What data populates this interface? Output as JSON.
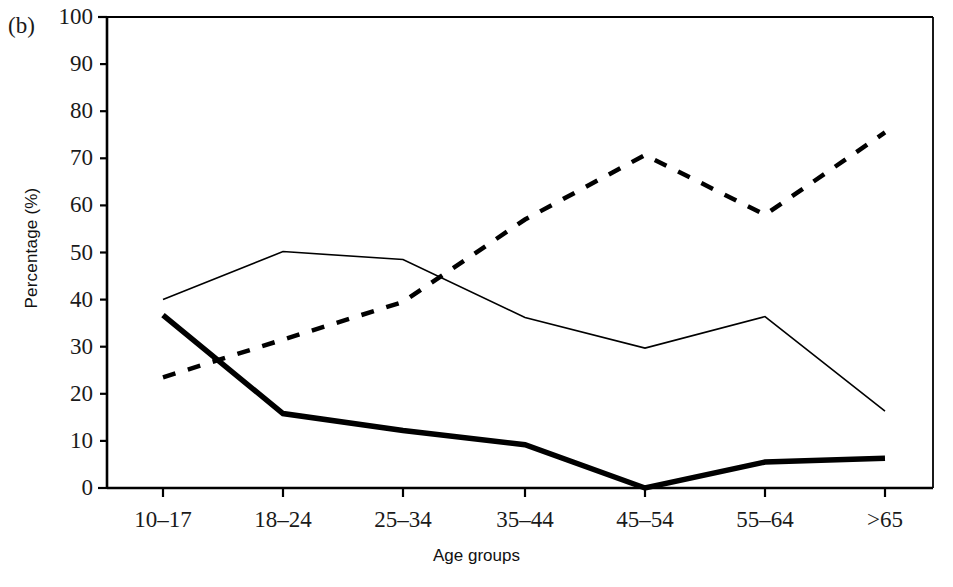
{
  "figure": {
    "panel_label": "(b)",
    "xlabel": "Age groups",
    "ylabel": "Percentage (%)"
  },
  "chart_data": {
    "type": "line",
    "title": "",
    "subtitle": "",
    "panel_label": "(b)",
    "xlabel": "Age groups",
    "ylabel": "Percentage (%)",
    "categories": [
      "10–17",
      "18–24",
      "25–34",
      "35–44",
      "45–54",
      "55–64",
      ">65"
    ],
    "ylim": [
      0,
      100
    ],
    "yticks": [
      0,
      10,
      20,
      30,
      40,
      50,
      60,
      70,
      80,
      90,
      100
    ],
    "ytick_labels": [
      "0",
      "10",
      "20",
      "30",
      "40",
      "50",
      "60",
      "70",
      "80",
      "90",
      "100"
    ],
    "grid": false,
    "legend": false,
    "legend_position": "none",
    "series": [
      {
        "name": "thin-solid-line",
        "style": "solid",
        "line_width": 1.6,
        "color": "#000000",
        "values": [
          40.0,
          50.2,
          48.5,
          36.2,
          29.7,
          36.4,
          16.3
        ]
      },
      {
        "name": "thick-solid-line",
        "style": "solid",
        "line_width": 5.5,
        "color": "#000000",
        "values": [
          36.7,
          15.8,
          12.2,
          9.2,
          0.0,
          5.5,
          6.3
        ]
      },
      {
        "name": "dashed-line",
        "style": "dashed",
        "line_width": 4.5,
        "color": "#000000",
        "values": [
          23.5,
          31.5,
          39.5,
          57.0,
          70.7,
          58.0,
          75.5
        ]
      }
    ]
  },
  "axes": {
    "x_positions": [
      163,
      283,
      403,
      525,
      645,
      765,
      885
    ],
    "plot_left": 107,
    "plot_right": 933,
    "plot_top": 17,
    "plot_bottom": 488
  }
}
